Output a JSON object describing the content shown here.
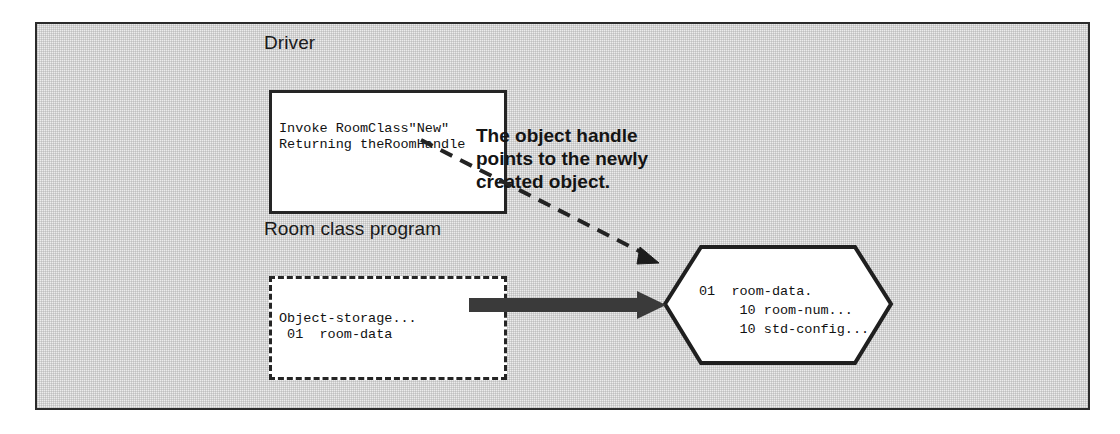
{
  "figure": {
    "background_color": "#ececec",
    "frame_color": "#2b2b2b",
    "ink_color": "#252525"
  },
  "driver": {
    "label": "Driver",
    "code": "Invoke RoomClass\"New\"\nReturning theRoomHandle"
  },
  "room_class": {
    "label": "Room class program",
    "code": "Object-storage...\n 01  room-data"
  },
  "object_instance": {
    "code": "01  room-data.\n     10 room-num...\n     10 std-config..."
  },
  "annotation": {
    "text": "The object handle\npoints to the newly\ncreated object."
  },
  "arrows": {
    "handle_arrow_name": "dashed-handle-pointer-arrow",
    "instantiate_arrow_name": "thick-instantiation-arrow"
  }
}
